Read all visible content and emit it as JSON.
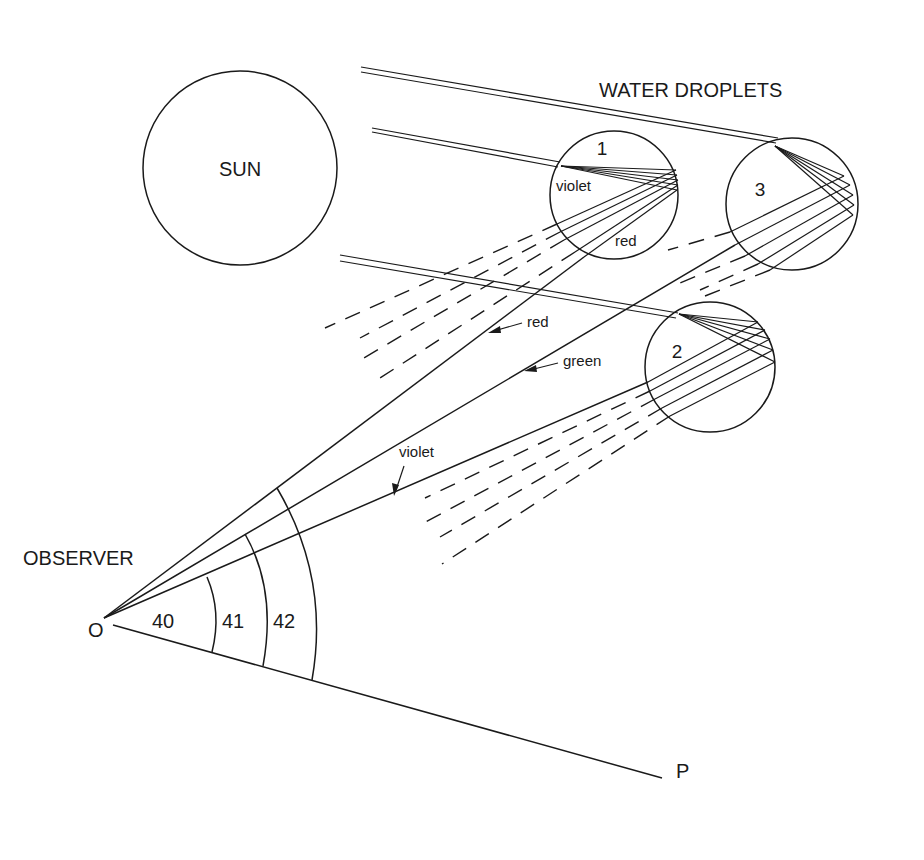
{
  "diagram": {
    "title": "WATER DROPLETS",
    "sun": {
      "label": "SUN"
    },
    "droplets": [
      {
        "id": "1",
        "label": "1",
        "inner_labels": [
          "violet",
          "red"
        ]
      },
      {
        "id": "2",
        "label": "2"
      },
      {
        "id": "3",
        "label": "3"
      }
    ],
    "rays": {
      "red_label": "red",
      "green_label": "green",
      "violet_label": "violet"
    },
    "observer": {
      "label": "OBSERVER",
      "point_label": "O",
      "horizon_point_label": "P"
    },
    "angles": [
      {
        "label": "40"
      },
      {
        "label": "41"
      },
      {
        "label": "42"
      }
    ],
    "colors": {
      "ink": "#1a1a1a",
      "background": "#ffffff"
    }
  }
}
